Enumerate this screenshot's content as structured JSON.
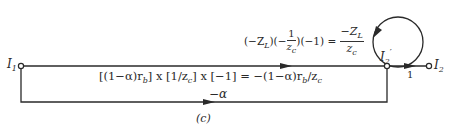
{
  "figure": {
    "caption": "(c)",
    "type": "signal-flow graph"
  },
  "nodes": {
    "input": {
      "label": "I",
      "subscript": "1"
    },
    "internal": {
      "label": "I",
      "subscript": "2",
      "prime": "′"
    },
    "output": {
      "label": "I",
      "subscript": "2"
    }
  },
  "branches": {
    "forward_top": {
      "gain_prefix": "[(1−α)r",
      "gain_sub1": "b",
      "gain_mid1": "] x [1/z",
      "gain_sub2": "c",
      "gain_mid2": "] x [−1] = −(1−α)r",
      "gain_sub3": "b",
      "gain_mid3": "/z",
      "gain_sub4": "c"
    },
    "forward_bottom": {
      "gain": "−α"
    },
    "output_branch": {
      "gain": "1"
    },
    "self_loop": {
      "lhs_1": "(−Z",
      "lhs_1_sub": "L",
      "lhs_2": ")(−",
      "lhs_frac_num": "1",
      "lhs_frac_den": "z",
      "lhs_frac_den_sub": "c",
      "lhs_3": ")(−1) =",
      "rhs_num": "−Z",
      "rhs_num_sub": "L",
      "rhs_den": "z",
      "rhs_den_sub": "c"
    }
  },
  "colors": {
    "ink": "#2a2a2a",
    "background": "#ffffff"
  }
}
